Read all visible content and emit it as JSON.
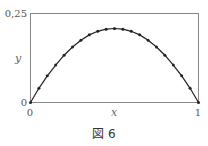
{
  "chart_data": {
    "type": "line",
    "title": "",
    "xlabel": "x",
    "ylabel": "y",
    "xlim": [
      0,
      1
    ],
    "ylim": [
      0,
      0.25
    ],
    "x_ticks": [
      "0",
      "1"
    ],
    "y_ticks": [
      "0",
      "0,25"
    ],
    "grid": false,
    "legend": null,
    "series": [
      {
        "name": "curve",
        "markers": true,
        "x": [
          0,
          0.05,
          0.1,
          0.15,
          0.2,
          0.25,
          0.3,
          0.35,
          0.4,
          0.45,
          0.5,
          0.55,
          0.6,
          0.65,
          0.7,
          0.75,
          0.8,
          0.85,
          0.9,
          0.95,
          1
        ],
        "y": [
          0,
          0.04,
          0.075,
          0.105,
          0.133,
          0.156,
          0.175,
          0.19,
          0.2,
          0.206,
          0.208,
          0.206,
          0.2,
          0.19,
          0.175,
          0.156,
          0.133,
          0.105,
          0.075,
          0.04,
          0
        ]
      }
    ]
  },
  "labels": {
    "y_top": "0,25",
    "y_zero": "0",
    "x_zero": "0",
    "x_one": "1",
    "x_axis": "x",
    "y_axis": "y",
    "caption": "図 6"
  }
}
